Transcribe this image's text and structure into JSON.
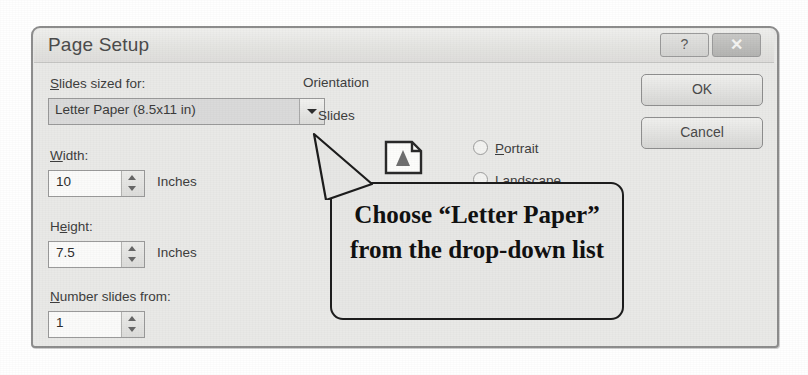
{
  "dialog": {
    "title": "Page Setup",
    "titlebar_buttons": [
      {
        "name": "help",
        "label": "?"
      },
      {
        "name": "close",
        "label": "✕"
      }
    ],
    "slides_sized_for": {
      "label_prefix": "S",
      "label_rest": "lides sized for:",
      "selected_option": "Letter Paper (8.5x11 in)"
    },
    "width": {
      "label_prefix": "W",
      "label_rest": "idth:",
      "value": "10",
      "unit": "Inches"
    },
    "height": {
      "label_prefix": "H",
      "label_mid": "e",
      "label_rest": "ight:",
      "value": "7.5",
      "unit": "Inches"
    },
    "number_slides_from": {
      "label_prefix": "N",
      "label_rest": "umber slides from:",
      "value": "1"
    },
    "orientation": {
      "group_label": "Orientation",
      "subgroup_label": "Slides",
      "options": [
        {
          "prefix": "P",
          "rest": "ortrait",
          "selected": false
        },
        {
          "prefix": "L",
          "rest": "andscape",
          "selected": true
        }
      ]
    },
    "buttons": {
      "ok": "OK",
      "cancel": "Cancel"
    }
  },
  "annotation": {
    "callout_text": "Choose “Letter Paper” from the drop-down list"
  },
  "colors": {
    "dialog_face": "#e9e9e7",
    "dialog_border": "#8d8d8d",
    "titlebar": "#e4e4e1",
    "dropdown_face": "#dadada",
    "callout_border": "#1d1d1d",
    "text": "#3e3e3e"
  }
}
